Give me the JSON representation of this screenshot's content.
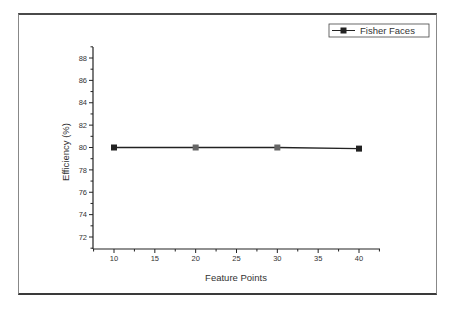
{
  "chart_data": {
    "type": "line",
    "title": "",
    "xlabel": "Feature Points",
    "ylabel": "Efficiency (%)",
    "x": [
      10,
      20,
      30,
      40
    ],
    "series": [
      {
        "name": "Fisher Faces",
        "values": [
          80.0,
          80.0,
          80.0,
          79.9
        ],
        "color": "#222222",
        "marker": "square"
      }
    ],
    "xlim": [
      7.5,
      42.5
    ],
    "ylim": [
      71,
      89
    ],
    "xticks": [
      10,
      15,
      20,
      25,
      30,
      35,
      40
    ],
    "yticks": [
      72,
      74,
      76,
      78,
      80,
      82,
      84,
      86,
      88
    ],
    "grid": false,
    "legend_position": "top-right"
  },
  "legend": {
    "label": "Fisher Faces"
  },
  "axes": {
    "xlabel": "Feature Points",
    "ylabel": "Efficiency (%)"
  }
}
